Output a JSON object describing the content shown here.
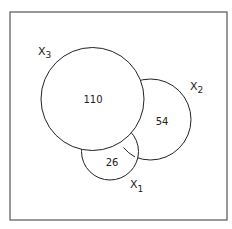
{
  "diagram": {
    "type": "venn",
    "frame": {
      "x": 10,
      "y": 12,
      "width": 217,
      "height": 208
    },
    "sets": [
      {
        "name": "X1",
        "label_base": "X",
        "label_sub": "1",
        "cx": 110,
        "cy": 151.5,
        "r": 28.5,
        "label_x": 131,
        "label_y": 188
      },
      {
        "name": "X2",
        "label_base": "X",
        "label_sub": "2",
        "cx": 150.5,
        "cy": 119.5,
        "r": 40.5,
        "label_x": 190,
        "label_y": 88
      },
      {
        "name": "X3",
        "label_base": "X",
        "label_sub": "3",
        "cx": 92.5,
        "cy": 99,
        "r": 51.5,
        "label_x": 40,
        "label_y": 50
      }
    ],
    "regions": [
      {
        "set": "X3",
        "value": "110",
        "x": 93,
        "y": 103
      },
      {
        "set": "X2",
        "value": "54",
        "x": 162,
        "y": 125
      },
      {
        "set": "X1",
        "value": "26",
        "x": 112,
        "y": 166
      }
    ],
    "colors": {
      "stroke": "#222222",
      "frame": "#555555",
      "background": "#ffffff"
    }
  }
}
